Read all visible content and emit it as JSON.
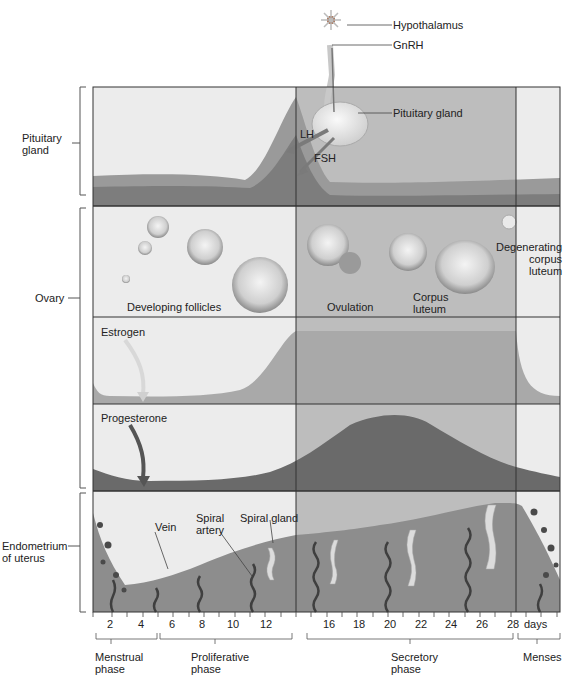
{
  "side_labels": {
    "pituitary": [
      "Pituitary",
      "gland"
    ],
    "ovary": "Ovary",
    "endometrium": [
      "Endometrium",
      "of uterus"
    ]
  },
  "top_labels": {
    "hypothalamus": "Hypothalamus",
    "gnrh": "GnRH",
    "pituitary_gland": "Pituitary gland",
    "lh": "LH",
    "fsh": "FSH"
  },
  "ovary_labels": {
    "developing_follicles": "Developing follicles",
    "ovulation": "Ovulation",
    "corpus_luteum": [
      "Corpus",
      "luteum"
    ],
    "degenerating": [
      "Degenerating",
      "corpus",
      "luteum"
    ]
  },
  "hormone_labels": {
    "estrogen": "Estrogen",
    "progesterone": "Progesterone"
  },
  "endometrium_labels": {
    "vein": "Vein",
    "spiral_artery": [
      "Spiral",
      "artery"
    ],
    "spiral_gland": "Spiral gland"
  },
  "axis": {
    "ticks": [
      "2",
      "4",
      "6",
      "8",
      "10",
      "12",
      "16",
      "18",
      "20",
      "22",
      "24",
      "26",
      "28"
    ],
    "unit": "days"
  },
  "phases": {
    "menstrual": [
      "Menstrual",
      "phase"
    ],
    "proliferative": [
      "Proliferative",
      "phase"
    ],
    "secretory": [
      "Secretory",
      "phase"
    ],
    "menses": "Menses"
  },
  "colors": {
    "panel_light": "#ececec",
    "panel_secretory": "#bdbdbd",
    "curve_dark": "#7a7a7a",
    "curve_mid": "#9a9a9a",
    "curve_darkest": "#5a5a5a",
    "border": "#333333"
  }
}
